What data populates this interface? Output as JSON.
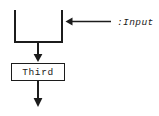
{
  "diagram": {
    "type": "activity-flow",
    "canvas": {
      "width": 159,
      "height": 116,
      "background": "#ffffff"
    },
    "stroke_color": "#1c1c1c",
    "text_color": "#1a1a1a",
    "nodes": [
      {
        "id": "join-bar",
        "kind": "merge-join-bracket",
        "label": "",
        "shape": "u-bracket"
      },
      {
        "id": "third-activity",
        "kind": "activity-box",
        "label": "Third",
        "shape": "rectangle"
      }
    ],
    "edges": [
      {
        "id": "input-edge",
        "label": ":Input",
        "direction": "left",
        "from": "input-source",
        "to": "join-bar"
      },
      {
        "id": "join-to-third",
        "label": "",
        "direction": "down",
        "from": "join-bar",
        "to": "third-activity"
      },
      {
        "id": "third-outgoing",
        "label": "",
        "direction": "down",
        "from": "third-activity",
        "to": "flow-exit"
      }
    ]
  }
}
